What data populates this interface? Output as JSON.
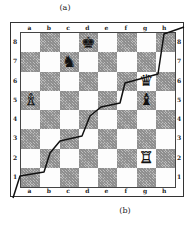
{
  "captions": {
    "top": "(a)",
    "bottom": "(b)"
  },
  "board": {
    "files": [
      "a",
      "b",
      "c",
      "d",
      "e",
      "f",
      "g",
      "h"
    ],
    "ranks": [
      "8",
      "7",
      "6",
      "5",
      "4",
      "3",
      "2",
      "1"
    ],
    "square_colors": {
      "light": "#fdfdfd",
      "dark": "#9a9a9a"
    },
    "pieces": [
      {
        "square": "d8",
        "color": "black",
        "type": "king",
        "glyph": "♚"
      },
      {
        "square": "c7",
        "color": "black",
        "type": "knight",
        "glyph": "♞"
      },
      {
        "square": "g6",
        "color": "black",
        "type": "queen",
        "glyph": "♛"
      },
      {
        "square": "g5",
        "color": "black",
        "type": "bishop",
        "glyph": "♝"
      },
      {
        "square": "a5",
        "color": "white",
        "type": "bishop",
        "glyph": "♗"
      },
      {
        "square": "g2",
        "color": "white",
        "type": "rook",
        "glyph": "♖"
      }
    ]
  },
  "staircase_line": {
    "description": "Stepped line from outer bottom-left corner (b) to outer top-right corner (a)",
    "points": [
      [
        13,
        198
      ],
      [
        20,
        176
      ],
      [
        44,
        172
      ],
      [
        50,
        153
      ],
      [
        60,
        141
      ],
      [
        82,
        136
      ],
      [
        90,
        116
      ],
      [
        101,
        107
      ],
      [
        120,
        103
      ],
      [
        125,
        83
      ],
      [
        158,
        74
      ],
      [
        164,
        34
      ],
      [
        184,
        27
      ]
    ]
  }
}
